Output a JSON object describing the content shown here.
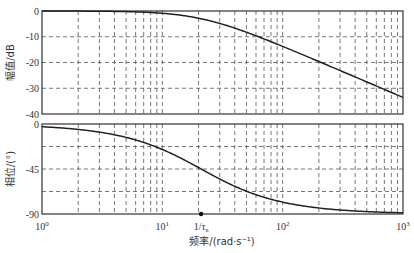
{
  "chart_data": {
    "type": "line",
    "title": "",
    "xscale": "log",
    "x_range": [
      1,
      1000
    ],
    "xlabel": "频率/(rad·s⁻¹)",
    "x_ticks": [
      "10^0",
      "10^1",
      "10^2",
      "10^3"
    ],
    "x_marker": {
      "label": "1/τn",
      "x": 21
    },
    "grid": true,
    "panels": [
      {
        "name": "magnitude",
        "ylabel": "幅值/dB",
        "ylim": [
          -40,
          0
        ],
        "y_ticks": [
          0,
          -10,
          -20,
          -30,
          -40
        ],
        "series": [
          {
            "name": "magnitude",
            "x": [
              1,
              2,
              5,
              10,
              21,
              50,
              100,
              200,
              500,
              1000
            ],
            "y": [
              0,
              -0.04,
              -0.24,
              -0.87,
              -3.0,
              -8.4,
              -13.7,
              -19.6,
              -27.6,
              -33.6
            ]
          }
        ]
      },
      {
        "name": "phase",
        "ylabel": "相位/(°)",
        "ylim": [
          -90,
          0
        ],
        "y_ticks": [
          0,
          -45,
          -90
        ],
        "series": [
          {
            "name": "phase",
            "x": [
              1,
              2,
              5,
              10,
              21,
              50,
              100,
              200,
              500,
              1000
            ],
            "y": [
              -2.7,
              -5.4,
              -13.4,
              -25.5,
              -45,
              -67.2,
              -78.1,
              -84.0,
              -87.6,
              -88.8
            ]
          }
        ]
      }
    ]
  },
  "labels": {
    "top_ylabel": "幅值/dB",
    "bottom_ylabel": "相位/(°)",
    "xlabel": "频率/(rad·s⁻¹)",
    "marker": "1/τ",
    "marker_sub": "n",
    "top_ticks": [
      "0",
      "-10",
      "-20",
      "-30",
      "-40"
    ],
    "bottom_ticks": [
      "0",
      "-45",
      "-90"
    ],
    "x_tick_base": "10",
    "x_tick_exps": [
      "0",
      "1",
      "2",
      "3"
    ]
  },
  "colors": {
    "curve": "#222222",
    "grid": "#555555",
    "frame": "#333333"
  }
}
